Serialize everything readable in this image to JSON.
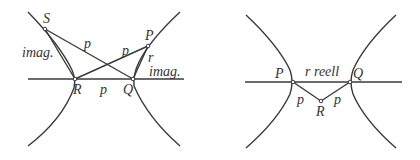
{
  "left_diagram": {
    "points": {
      "S": "S",
      "P": "P",
      "R": "R",
      "Q": "Q"
    },
    "labels": {
      "imag_left": "imag.",
      "imag_right": "imag.",
      "p_SQ": "p",
      "p_RP": "p",
      "p_RQ": "p",
      "r_PQ": "r"
    }
  },
  "right_diagram": {
    "points": {
      "P": "P",
      "Q": "Q",
      "R": "R"
    },
    "labels": {
      "r_reell": "r reell",
      "p_PR": "p",
      "p_RQ": "p"
    }
  }
}
